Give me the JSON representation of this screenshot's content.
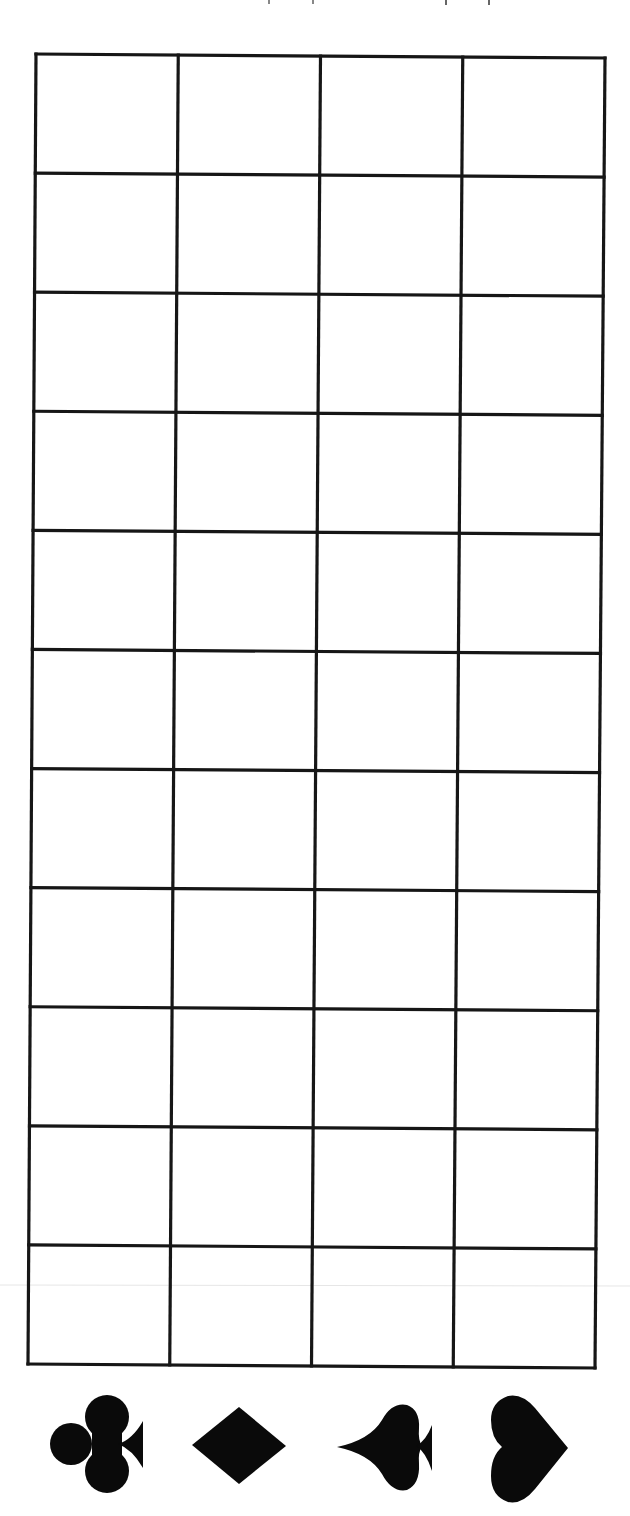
{
  "worksheet": {
    "grid": {
      "rows": 11,
      "columns": 4,
      "line_color": "#161616",
      "corners": {
        "top_left": [
          36,
          54
        ],
        "top_right": [
          605,
          58
        ],
        "bottom_left": [
          28,
          1364
        ],
        "bottom_right": [
          595,
          1368
        ]
      },
      "cells_filled": []
    },
    "column_suits": [
      {
        "name": "clubs",
        "icon": "club-icon",
        "orientation": "rotated-90-stem-right",
        "center": [
          95,
          1445
        ]
      },
      {
        "name": "diamonds",
        "icon": "diamond-icon",
        "orientation": "horizontal",
        "center": [
          239,
          1446
        ]
      },
      {
        "name": "spades",
        "icon": "spade-icon",
        "orientation": "rotated-point-left-stem-right",
        "center": [
          385,
          1447
        ]
      },
      {
        "name": "hearts",
        "icon": "heart-icon",
        "orientation": "rotated-point-right",
        "center": [
          530,
          1448
        ]
      }
    ],
    "colors": {
      "background": "#ffffff",
      "ink": "#0a0a0a"
    }
  }
}
